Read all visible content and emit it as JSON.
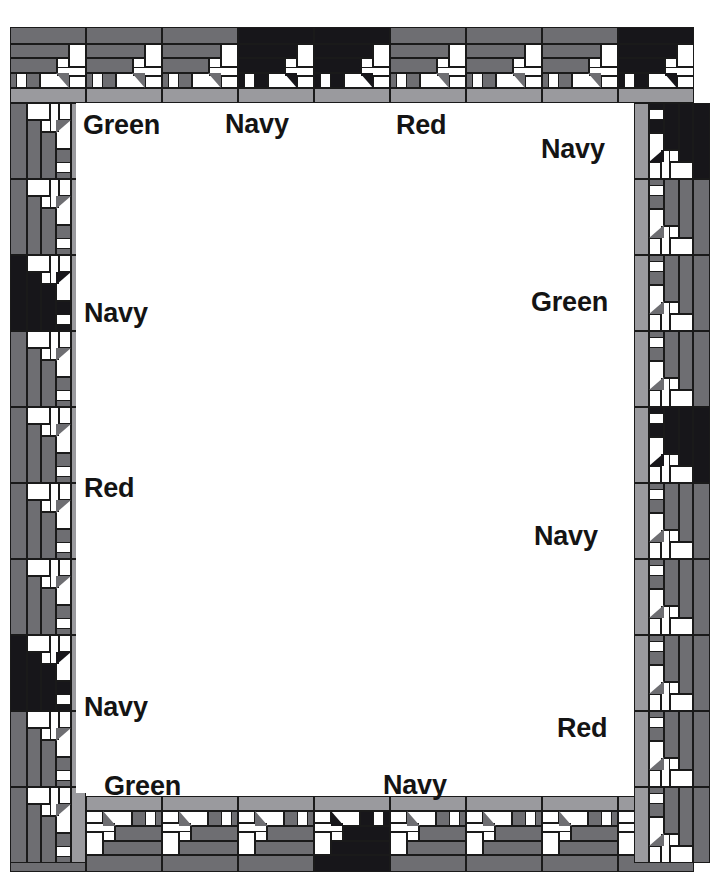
{
  "diagram": {
    "kind": "quilt-border-diagram",
    "canvas": {
      "width": 720,
      "height": 885
    },
    "frame": {
      "left": 10,
      "top": 27,
      "width": 700,
      "height": 845,
      "block_size": 76
    },
    "palette": {
      "white": "#ffffff",
      "dark": "#17161a",
      "medium": "#6e6e72",
      "light": "#9a9a9e",
      "outline": "#1a1a1a",
      "text": "#141414"
    },
    "fabrics": [
      "Green",
      "Navy",
      "Red"
    ],
    "labels": [
      {
        "id": "label-top-green",
        "text": "Green",
        "x": 83,
        "y": 112
      },
      {
        "id": "label-top-navy",
        "text": "Navy",
        "x": 225,
        "y": 111
      },
      {
        "id": "label-top-red",
        "text": "Red",
        "x": 396,
        "y": 112
      },
      {
        "id": "label-topright-navy",
        "text": "Navy",
        "x": 541,
        "y": 136
      },
      {
        "id": "label-left-navy-upper",
        "text": "Navy",
        "x": 84,
        "y": 300
      },
      {
        "id": "label-right-green",
        "text": "Green",
        "x": 531,
        "y": 289
      },
      {
        "id": "label-left-red",
        "text": "Red",
        "x": 84,
        "y": 475
      },
      {
        "id": "label-right-navy-lower",
        "text": "Navy",
        "x": 534,
        "y": 523
      },
      {
        "id": "label-left-navy-lower",
        "text": "Navy",
        "x": 84,
        "y": 694
      },
      {
        "id": "label-bottomright-red",
        "text": "Red",
        "x": 557,
        "y": 715
      },
      {
        "id": "label-bottom-green",
        "text": "Green",
        "x": 104,
        "y": 773
      },
      {
        "id": "label-bottom-navy",
        "text": "Navy",
        "x": 383,
        "y": 772
      }
    ],
    "blocks": {
      "top_row": [
        "medium",
        "medium",
        "medium",
        "dark",
        "dark",
        "medium",
        "medium",
        "medium",
        "dark"
      ],
      "bottom_row": [
        "medium",
        "medium",
        "medium",
        "medium",
        "dark",
        "medium",
        "medium",
        "medium",
        "medium"
      ],
      "left_col": [
        "medium",
        "medium",
        "dark",
        "medium",
        "medium",
        "medium",
        "medium",
        "dark",
        "medium",
        "medium"
      ],
      "right_col": [
        "dark",
        "medium",
        "medium",
        "medium",
        "dark",
        "medium",
        "medium",
        "medium",
        "medium",
        "medium"
      ]
    }
  }
}
